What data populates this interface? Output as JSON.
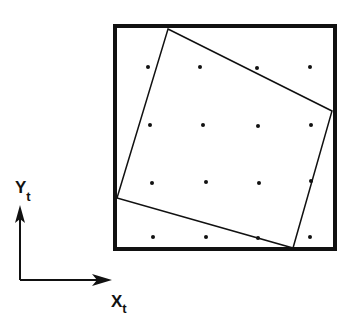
{
  "figure": {
    "type": "rotated-square-over-grid",
    "outer_square": {
      "x": 115,
      "y": 26,
      "width": 220,
      "height": 223,
      "stroke": "#111111",
      "stroke_width": 4
    },
    "rotated_square": {
      "points": [
        [
          168,
          29
        ],
        [
          332,
          111
        ],
        [
          293,
          248
        ],
        [
          117,
          198
        ]
      ],
      "stroke": "#111111",
      "stroke_width": 1.5
    },
    "grid_points": [
      [
        148,
        67
      ],
      [
        200,
        67
      ],
      [
        257,
        68
      ],
      [
        310,
        67
      ],
      [
        150,
        125
      ],
      [
        203,
        125
      ],
      [
        258,
        126
      ],
      [
        311,
        125
      ],
      [
        152,
        183
      ],
      [
        206,
        182
      ],
      [
        259,
        183
      ],
      [
        311,
        181
      ],
      [
        153,
        237
      ],
      [
        206,
        237
      ],
      [
        258,
        238
      ],
      [
        310,
        237
      ]
    ],
    "dot_radius": 2
  },
  "axes": {
    "origin": [
      20,
      280
    ],
    "y_tip": [
      20,
      205
    ],
    "x_tip": [
      112,
      280
    ],
    "y_label": {
      "main": "Y",
      "sub": "t"
    },
    "x_label": {
      "main": "X",
      "sub": "t"
    }
  }
}
